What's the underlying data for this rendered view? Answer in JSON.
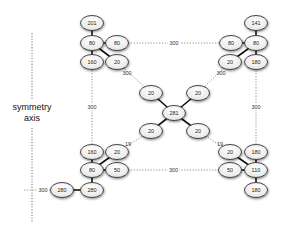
{
  "diagram": {
    "axis": {
      "label_line1": "symmetry",
      "label_line2": "axis",
      "x": 32,
      "y1": 33,
      "y2": 222
    },
    "nodes": [
      {
        "id": "tl_top",
        "label": "201",
        "x": 92,
        "y": 23
      },
      {
        "id": "tl_hub",
        "label": "80",
        "x": 92,
        "y": 43
      },
      {
        "id": "tl_right",
        "label": "80",
        "x": 117,
        "y": 43
      },
      {
        "id": "tl_bottom",
        "label": "160",
        "x": 92,
        "y": 62
      },
      {
        "id": "tl_diag",
        "label": "20",
        "x": 117,
        "y": 62
      },
      {
        "id": "tr_top",
        "label": "141",
        "x": 256,
        "y": 23
      },
      {
        "id": "tr_hub",
        "label": "80",
        "x": 256,
        "y": 43
      },
      {
        "id": "tr_left",
        "label": "80",
        "x": 231,
        "y": 43
      },
      {
        "id": "tr_diag",
        "label": "20",
        "x": 230,
        "y": 62
      },
      {
        "id": "tr_bottom",
        "label": "180",
        "x": 256,
        "y": 62
      },
      {
        "id": "c_ul",
        "label": "20",
        "x": 151,
        "y": 93
      },
      {
        "id": "c_ur",
        "label": "20",
        "x": 198,
        "y": 93
      },
      {
        "id": "c_hub",
        "label": "281",
        "x": 174,
        "y": 113
      },
      {
        "id": "c_ll",
        "label": "20",
        "x": 151,
        "y": 131
      },
      {
        "id": "c_lr",
        "label": "20",
        "x": 198,
        "y": 131
      },
      {
        "id": "bl_top",
        "label": "160",
        "x": 92,
        "y": 152
      },
      {
        "id": "bl_diag",
        "label": "20",
        "x": 117,
        "y": 152
      },
      {
        "id": "bl_hub",
        "label": "80",
        "x": 92,
        "y": 170
      },
      {
        "id": "bl_right",
        "label": "50",
        "x": 117,
        "y": 170
      },
      {
        "id": "bl_left",
        "label": "280",
        "x": 62,
        "y": 190
      },
      {
        "id": "bl_bottom",
        "label": "280",
        "x": 92,
        "y": 190
      },
      {
        "id": "br_diag",
        "label": "20",
        "x": 230,
        "y": 152
      },
      {
        "id": "br_top",
        "label": "180",
        "x": 256,
        "y": 152
      },
      {
        "id": "br_left",
        "label": "50",
        "x": 230,
        "y": 170
      },
      {
        "id": "br_hub",
        "label": "110",
        "x": 256,
        "y": 170
      },
      {
        "id": "br_bottom",
        "label": "180",
        "x": 256,
        "y": 190
      }
    ],
    "solid_edges": [
      [
        "tl_top",
        "tl_hub"
      ],
      [
        "tl_hub",
        "tl_right"
      ],
      [
        "tl_hub",
        "tl_bottom"
      ],
      [
        "tl_hub",
        "tl_diag"
      ],
      [
        "tr_top",
        "tr_hub"
      ],
      [
        "tr_hub",
        "tr_left"
      ],
      [
        "tr_hub",
        "tr_bottom"
      ],
      [
        "tr_hub",
        "tr_diag"
      ],
      [
        "c_hub",
        "c_ul"
      ],
      [
        "c_hub",
        "c_ur"
      ],
      [
        "c_hub",
        "c_ll"
      ],
      [
        "c_hub",
        "c_lr"
      ],
      [
        "bl_top",
        "bl_hub"
      ],
      [
        "bl_hub",
        "bl_diag"
      ],
      [
        "bl_hub",
        "bl_right"
      ],
      [
        "bl_hub",
        "bl_bottom"
      ],
      [
        "bl_left",
        "bl_bottom"
      ],
      [
        "br_top",
        "br_hub"
      ],
      [
        "br_hub",
        "br_diag"
      ],
      [
        "br_hub",
        "br_left"
      ],
      [
        "br_hub",
        "br_bottom"
      ]
    ],
    "dashed_edges": [
      {
        "from": "tl_right",
        "to": "tr_left",
        "label": "300"
      },
      {
        "from": "tl_bottom",
        "to": "bl_top",
        "label": "300"
      },
      {
        "from": "tr_bottom",
        "to": "br_top",
        "label": "300"
      },
      {
        "from": "bl_right",
        "to": "br_left",
        "label": "300"
      },
      {
        "from": "tl_diag",
        "to": "c_ul",
        "label": "300"
      },
      {
        "from": "tr_diag",
        "to": "c_ur",
        "label": "300"
      },
      {
        "from": "bl_diag",
        "to": "c_ll",
        "label": "19"
      },
      {
        "from": "br_diag",
        "to": "c_lr",
        "label": "19"
      }
    ],
    "axis_link": {
      "label": "300",
      "x1": 32,
      "x2": 50,
      "y": 190
    }
  }
}
